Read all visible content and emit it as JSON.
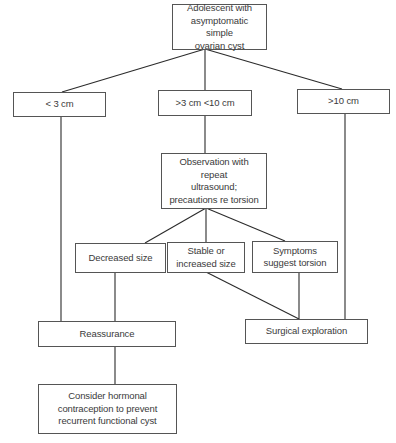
{
  "diagram": {
    "type": "flowchart",
    "nodes": {
      "root": "Adolescent with\nasymptomatic simple\novarian cyst",
      "lt3": "< 3 cm",
      "mid": ">3 cm <10 cm",
      "gt10": ">10 cm",
      "observation": "Observation with repeat\nultrasound;\nprecautions re torsion",
      "decreased": "Decreased size",
      "stable": "Stable or\nincreased size",
      "symptoms": "Symptoms\nsuggest torsion",
      "reassurance": "Reassurance",
      "surgical": "Surgical exploration",
      "hormonal": "Consider hormonal\ncontraception to prevent\nrecurrent functional cyst"
    },
    "edges": [
      {
        "from": "root",
        "to": "lt3"
      },
      {
        "from": "root",
        "to": "mid"
      },
      {
        "from": "root",
        "to": "gt10"
      },
      {
        "from": "lt3",
        "to": "reassurance"
      },
      {
        "from": "mid",
        "to": "observation"
      },
      {
        "from": "gt10",
        "to": "surgical"
      },
      {
        "from": "observation",
        "to": "decreased"
      },
      {
        "from": "observation",
        "to": "stable"
      },
      {
        "from": "observation",
        "to": "symptoms"
      },
      {
        "from": "decreased",
        "to": "reassurance"
      },
      {
        "from": "stable",
        "to": "surgical"
      },
      {
        "from": "symptoms",
        "to": "surgical"
      },
      {
        "from": "reassurance",
        "to": "hormonal"
      }
    ],
    "colors": {
      "line": "#2b2b2b",
      "border": "#555555",
      "text": "#3a3a3a",
      "background": "#ffffff"
    }
  }
}
